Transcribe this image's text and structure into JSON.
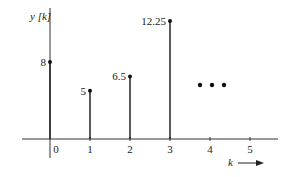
{
  "chart_data": {
    "type": "stem",
    "title": "",
    "xlabel": "k",
    "ylabel": "y [k]",
    "x": [
      0,
      1,
      2,
      3
    ],
    "values": [
      8,
      5,
      6.5,
      12.25
    ],
    "value_labels": [
      "8",
      "5",
      "6.5",
      "12.25"
    ],
    "x_ticks": [
      "0",
      "1",
      "2",
      "3",
      "4",
      "5"
    ],
    "continuation": "...",
    "continuation_dots_at_x": 4,
    "grid": false,
    "legend": null,
    "ylim": [
      0,
      13
    ],
    "xlim": [
      -0.7,
      5.7
    ]
  },
  "labels": {
    "ylabel": "y [k]",
    "xlabel": "k",
    "arrow": "→"
  }
}
